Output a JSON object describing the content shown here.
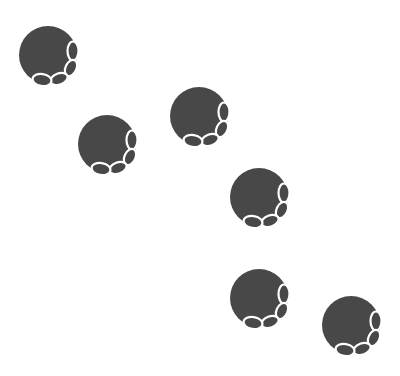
{
  "canvas": {
    "width": 400,
    "height": 376,
    "background": "#ffffff"
  },
  "style": {
    "fill": "#484848",
    "outline": "#ffffff"
  },
  "figures": [
    {
      "id": "figure-1",
      "x": 48,
      "y": 55
    },
    {
      "id": "figure-2",
      "x": 107,
      "y": 144
    },
    {
      "id": "figure-3",
      "x": 199,
      "y": 116
    },
    {
      "id": "figure-4",
      "x": 259,
      "y": 197
    },
    {
      "id": "figure-5",
      "x": 259,
      "y": 298
    },
    {
      "id": "figure-6",
      "x": 351,
      "y": 325
    }
  ]
}
